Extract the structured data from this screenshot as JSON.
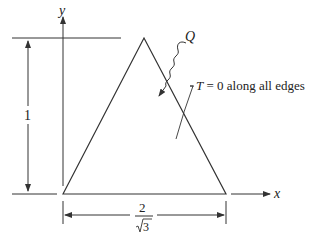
{
  "diagram": {
    "type": "triangle-heat-conduction",
    "axes": {
      "x_label": "x",
      "y_label": "y"
    },
    "height_dimension": {
      "label": "1"
    },
    "base_dimension": {
      "numerator": "2",
      "denominator_radical": "3",
      "denominator_label": "√3"
    },
    "heat_source": {
      "label": "Q"
    },
    "boundary_condition": {
      "label_var": "T",
      "label_rest": " = 0 along all edges"
    },
    "colors": {
      "stroke": "#333333",
      "text": "#222222",
      "background": "#ffffff"
    }
  }
}
